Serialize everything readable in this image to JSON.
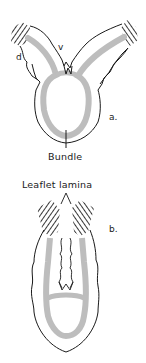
{
  "diagram": {
    "panels": [
      {
        "id": "a",
        "panel_label": "a.",
        "labels": {
          "dorsal": "d",
          "ventral": "v",
          "bundle": "Bundle"
        }
      },
      {
        "id": "b",
        "panel_label": "b.",
        "labels": {
          "leaflet_lamina": "Leaflet lamina"
        }
      }
    ],
    "colors": {
      "outline": "#1a1a1a",
      "vascular_tissue": "#bdbdbd",
      "hatching": "#222222",
      "background": "#ffffff"
    }
  }
}
